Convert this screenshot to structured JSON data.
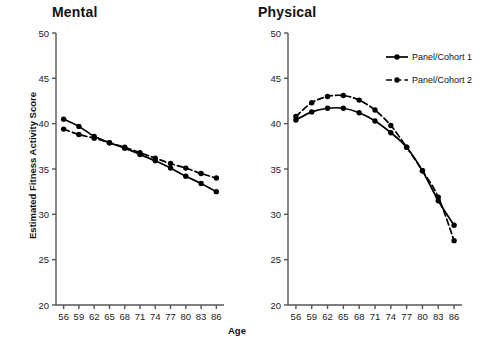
{
  "figure": {
    "xlabel": "Age",
    "ylabel": "Estimated Fitness Activity Score",
    "panels": [
      {
        "id": "mental",
        "title": "Mental"
      },
      {
        "id": "physical",
        "title": "Physical"
      }
    ],
    "legend": {
      "items": [
        {
          "label": "Panel/Cohort 1",
          "style": "solid"
        },
        {
          "label": "Panel/Cohort 2",
          "style": "dashed"
        }
      ]
    },
    "colors": {
      "line": "#000000",
      "marker": "#000000",
      "axis": "#555555",
      "background": "#ffffff"
    }
  },
  "chart_data": [
    {
      "type": "line",
      "title": "Mental",
      "xlabel": "Age",
      "ylabel": "Estimated Fitness Activity Score",
      "x": [
        56,
        59,
        62,
        65,
        68,
        71,
        74,
        77,
        80,
        83,
        86
      ],
      "xticklabels": [
        "56",
        "59",
        "62",
        "65",
        "68",
        "71",
        "74",
        "77",
        "80",
        "83",
        "86"
      ],
      "yticks": [
        20,
        25,
        30,
        35,
        40,
        45,
        50
      ],
      "yticklabels": [
        "20",
        "25",
        "30",
        "35",
        "40",
        "45",
        "50"
      ],
      "xlim": [
        54.5,
        87.5
      ],
      "ylim": [
        20,
        50
      ],
      "grid": false,
      "series": [
        {
          "name": "Panel/Cohort 1",
          "style": "solid",
          "marker": "circle",
          "values": [
            40.5,
            39.7,
            38.6,
            37.9,
            37.3,
            36.6,
            35.9,
            35.1,
            34.2,
            33.4,
            32.5
          ]
        },
        {
          "name": "Panel/Cohort 2",
          "style": "dashed",
          "marker": "circle",
          "values": [
            39.4,
            38.8,
            38.4,
            37.9,
            37.4,
            36.8,
            36.2,
            35.6,
            35.1,
            34.5,
            34.0
          ]
        }
      ]
    },
    {
      "type": "line",
      "title": "Physical",
      "xlabel": "Age",
      "ylabel": "Estimated Fitness Activity Score",
      "x": [
        56,
        59,
        62,
        65,
        68,
        71,
        74,
        77,
        80,
        83,
        86
      ],
      "xticklabels": [
        "56",
        "59",
        "62",
        "65",
        "68",
        "71",
        "74",
        "77",
        "80",
        "83",
        "86"
      ],
      "yticks": [
        20,
        25,
        30,
        35,
        40,
        45,
        50
      ],
      "yticklabels": [
        "20",
        "25",
        "30",
        "35",
        "40",
        "45",
        "50"
      ],
      "xlim": [
        54.5,
        87.5
      ],
      "ylim": [
        20,
        50
      ],
      "grid": false,
      "series": [
        {
          "name": "Panel/Cohort 1",
          "style": "solid",
          "marker": "circle",
          "values": [
            40.4,
            41.3,
            41.7,
            41.7,
            41.2,
            40.3,
            39.0,
            37.4,
            34.8,
            31.5,
            28.8
          ]
        },
        {
          "name": "Panel/Cohort 2",
          "style": "dashed",
          "marker": "circle",
          "values": [
            40.8,
            42.3,
            43.0,
            43.1,
            42.6,
            41.5,
            39.8,
            37.4,
            34.8,
            31.9,
            27.1
          ]
        }
      ]
    }
  ]
}
